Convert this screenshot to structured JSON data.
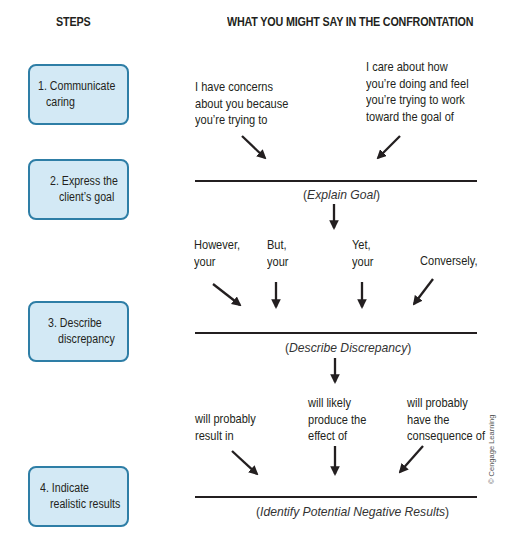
{
  "headers": {
    "steps": "STEPS",
    "what_to_say": "WHAT YOU MIGHT SAY IN THE CONFRONTATION"
  },
  "steps": [
    {
      "line1": "1. Communicate",
      "line2": "caring"
    },
    {
      "line1": "2. Express the",
      "line2": "client’s goal"
    },
    {
      "line1": "3. Describe",
      "line2": "discrepancy"
    },
    {
      "line1": "4. Indicate",
      "line2": "realistic results"
    }
  ],
  "stage1": {
    "phrases": [
      {
        "lines": [
          "I have concerns",
          "about you because",
          "you’re trying to"
        ]
      },
      {
        "lines": [
          "I care about how",
          "you’re doing and feel",
          "you’re trying to work",
          "toward the goal of"
        ]
      }
    ],
    "blank_label": {
      "open": "(",
      "italic": "Explain Goal",
      "close": ")"
    }
  },
  "stage2": {
    "phrases": [
      {
        "lines": [
          "However,",
          "your"
        ]
      },
      {
        "lines": [
          "But,",
          "your"
        ]
      },
      {
        "lines": [
          "Yet,",
          "your"
        ]
      },
      {
        "lines": [
          "Conversely,"
        ]
      }
    ],
    "blank_label": {
      "open": "(",
      "italic": "Describe Discrepancy",
      "close": ")"
    }
  },
  "stage3": {
    "phrases": [
      {
        "lines": [
          "will probably",
          "result in"
        ]
      },
      {
        "lines": [
          "will likely",
          "produce the",
          "effect of"
        ]
      },
      {
        "lines": [
          "will probably",
          "have the",
          "consequence of"
        ]
      }
    ],
    "blank_label": {
      "open": "(",
      "italic": "Identify Potential Negative Results",
      "close": ")"
    }
  },
  "copyright": "© Cengage Learning",
  "colors": {
    "box_fill": "#d3e9f5",
    "box_border": "#2e7ea6",
    "text": "#231f20"
  }
}
